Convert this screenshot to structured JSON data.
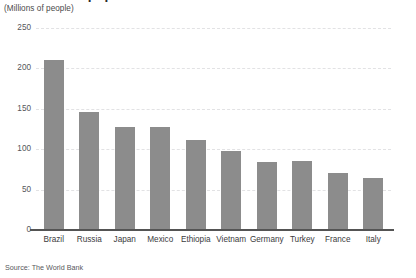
{
  "chart_data": {
    "type": "bar",
    "title": "The 10 most populous countries",
    "subtitle": "(Millions of people)",
    "xlabel": "",
    "ylabel": "",
    "categories": [
      "Brazil",
      "Russia",
      "Japan",
      "Mexico",
      "Ethiopia",
      "Vietnam",
      "Germany",
      "Turkey",
      "France",
      "Italy"
    ],
    "values": [
      211,
      146,
      127,
      127,
      112,
      98,
      84,
      85,
      70,
      64
    ],
    "series": [
      {
        "name": "Population",
        "values": [
          211,
          146,
          127,
          127,
          112,
          98,
          84,
          85,
          70,
          64
        ]
      }
    ],
    "ylim": [
      0,
      250
    ],
    "yticks": [
      0,
      50,
      100,
      150,
      200,
      250
    ],
    "ytick_labels": [
      "0",
      "50",
      "100",
      "150",
      "200",
      "250"
    ],
    "grid": true,
    "grid_style": "dashed-horizontal",
    "legend": false,
    "legend_position": "none",
    "bar_color": "#8c8c8c",
    "gridline_color": "#e2e2e4",
    "axis_color": "#545454",
    "background_color": "#ffffff"
  },
  "footer": {
    "source": "Source: The World Bank"
  }
}
